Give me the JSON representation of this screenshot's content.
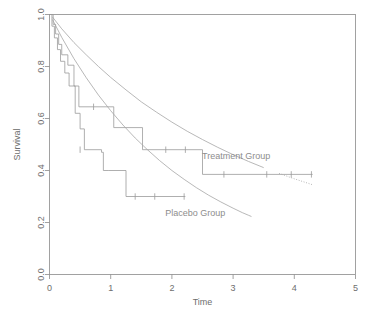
{
  "chart_data": {
    "type": "line",
    "title": "",
    "subtitle": "",
    "xlabel": "Time",
    "ylabel": "Survival",
    "xlim": [
      0,
      5
    ],
    "ylim": [
      0,
      1
    ],
    "xticks": [
      0,
      1,
      2,
      3,
      4,
      5
    ],
    "xticklabels": [
      "0",
      "1",
      "2",
      "3",
      "4",
      "5"
    ],
    "yticks": [
      0.0,
      0.2,
      0.4,
      0.6,
      0.8,
      1.0
    ],
    "yticklabels": [
      "0.0",
      "0.2",
      "0.4",
      "0.6",
      "0.8",
      "1.0"
    ],
    "grid": false,
    "legend_position": "inline-annotation",
    "line_color": "#9a9a9a",
    "fit_color": "#a6a6a6",
    "axis_color": "#8a8a8a",
    "text_color": "#6e6e6e",
    "annotations": [
      {
        "text": "Treatment Group",
        "x": 3.05,
        "y": 0.455,
        "name": "treatment-group-label"
      },
      {
        "text": "Placebo Group",
        "x": 2.38,
        "y": 0.235,
        "name": "placebo-group-label"
      }
    ],
    "series": [
      {
        "name": "Treatment Group",
        "style": "kaplan-meier-step",
        "steps": [
          [
            0.0,
            1.0
          ],
          [
            0.06,
            1.0
          ],
          [
            0.06,
            0.962
          ],
          [
            0.1,
            0.962
          ],
          [
            0.1,
            0.925
          ],
          [
            0.15,
            0.925
          ],
          [
            0.15,
            0.885
          ],
          [
            0.2,
            0.885
          ],
          [
            0.2,
            0.845
          ],
          [
            0.3,
            0.845
          ],
          [
            0.3,
            0.805
          ],
          [
            0.4,
            0.805
          ],
          [
            0.4,
            0.725
          ],
          [
            0.48,
            0.725
          ],
          [
            0.48,
            0.645
          ],
          [
            0.72,
            0.645
          ],
          [
            0.72,
            0.645
          ],
          [
            1.05,
            0.645
          ],
          [
            1.05,
            0.565
          ],
          [
            1.52,
            0.565
          ],
          [
            1.52,
            0.48
          ],
          [
            2.5,
            0.48
          ],
          [
            2.5,
            0.385
          ],
          [
            4.3,
            0.385
          ]
        ],
        "censored": [
          [
            0.72,
            0.645
          ],
          [
            1.9,
            0.48
          ],
          [
            2.22,
            0.48
          ],
          [
            2.85,
            0.385
          ],
          [
            3.55,
            0.385
          ],
          [
            3.95,
            0.385
          ],
          [
            4.28,
            0.385
          ]
        ]
      },
      {
        "name": "Placebo Group",
        "style": "kaplan-meier-step",
        "steps": [
          [
            0.0,
            1.0
          ],
          [
            0.04,
            1.0
          ],
          [
            0.04,
            0.955
          ],
          [
            0.08,
            0.955
          ],
          [
            0.08,
            0.91
          ],
          [
            0.13,
            0.91
          ],
          [
            0.13,
            0.865
          ],
          [
            0.18,
            0.865
          ],
          [
            0.18,
            0.82
          ],
          [
            0.25,
            0.82
          ],
          [
            0.25,
            0.775
          ],
          [
            0.32,
            0.775
          ],
          [
            0.32,
            0.725
          ],
          [
            0.42,
            0.725
          ],
          [
            0.42,
            0.62
          ],
          [
            0.5,
            0.62
          ],
          [
            0.5,
            0.56
          ],
          [
            0.57,
            0.56
          ],
          [
            0.57,
            0.48
          ],
          [
            0.85,
            0.48
          ],
          [
            0.85,
            0.47
          ],
          [
            0.88,
            0.47
          ],
          [
            0.88,
            0.4
          ],
          [
            0.97,
            0.4
          ],
          [
            0.97,
            0.4
          ],
          [
            1.25,
            0.4
          ],
          [
            1.25,
            0.3
          ],
          [
            2.22,
            0.3
          ]
        ],
        "censored": [
          [
            0.5,
            0.48
          ],
          [
            1.4,
            0.3
          ],
          [
            1.72,
            0.3
          ],
          [
            2.2,
            0.3
          ]
        ]
      },
      {
        "name": "Treatment fitted curve",
        "style": "smooth-fit",
        "dash_from_x": 3.55,
        "points": [
          [
            0.05,
            0.99
          ],
          [
            0.2,
            0.945
          ],
          [
            0.4,
            0.892
          ],
          [
            0.6,
            0.845
          ],
          [
            0.8,
            0.8
          ],
          [
            1.0,
            0.758
          ],
          [
            1.25,
            0.71
          ],
          [
            1.5,
            0.664
          ],
          [
            1.75,
            0.624
          ],
          [
            2.0,
            0.586
          ],
          [
            2.25,
            0.551
          ],
          [
            2.5,
            0.519
          ],
          [
            2.75,
            0.489
          ],
          [
            3.0,
            0.461
          ],
          [
            3.25,
            0.435
          ],
          [
            3.5,
            0.411
          ],
          [
            3.75,
            0.389
          ],
          [
            4.0,
            0.368
          ],
          [
            4.25,
            0.349
          ],
          [
            4.3,
            0.345
          ]
        ]
      },
      {
        "name": "Placebo fitted curve",
        "style": "smooth-fit",
        "dash_from_x": null,
        "points": [
          [
            0.05,
            0.98
          ],
          [
            0.2,
            0.912
          ],
          [
            0.4,
            0.83
          ],
          [
            0.6,
            0.757
          ],
          [
            0.8,
            0.69
          ],
          [
            1.0,
            0.63
          ],
          [
            1.2,
            0.575
          ],
          [
            1.4,
            0.525
          ],
          [
            1.6,
            0.48
          ],
          [
            1.8,
            0.438
          ],
          [
            2.0,
            0.4
          ],
          [
            2.2,
            0.366
          ],
          [
            2.4,
            0.334
          ],
          [
            2.6,
            0.305
          ],
          [
            2.8,
            0.279
          ],
          [
            3.0,
            0.255
          ],
          [
            3.15,
            0.238
          ],
          [
            3.25,
            0.228
          ],
          [
            3.3,
            0.223
          ]
        ]
      }
    ]
  }
}
